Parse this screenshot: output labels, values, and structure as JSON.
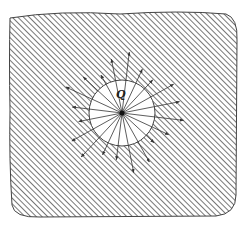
{
  "diagram": {
    "charge_label": "Q",
    "colors": {
      "hatch": "#555555",
      "border": "#444444",
      "background": "#ffffff",
      "field_line": "#333333"
    },
    "region": {
      "x": 8,
      "y": 12,
      "width": 229,
      "height": 205
    },
    "sphere": {
      "cx": 122,
      "cy": 113,
      "r": 33
    },
    "field_lines": {
      "count": 20,
      "inner_radius": 0,
      "outer_radius": 62
    }
  }
}
